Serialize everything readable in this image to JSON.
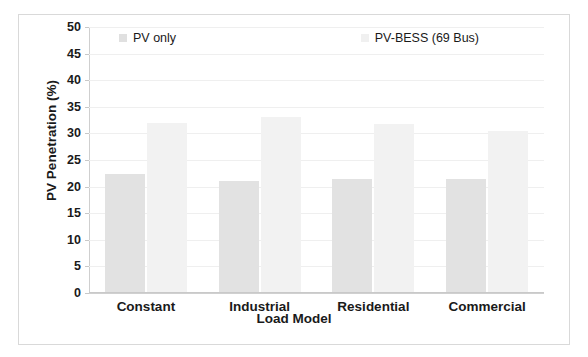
{
  "chart_data": {
    "type": "bar",
    "title": "",
    "xlabel": "Load Model",
    "ylabel": "PV Penetration (%)",
    "categories": [
      "Constant",
      "Industrial",
      "Residential",
      "Commercial"
    ],
    "series": [
      {
        "name": "PV only",
        "color": "#e2e2e2",
        "values": [
          22.4,
          21.0,
          21.5,
          21.5
        ]
      },
      {
        "name": "PV-BESS (69 Bus)",
        "color": "#f2f2f2",
        "values": [
          32.0,
          33.0,
          31.8,
          30.5
        ]
      }
    ],
    "ylim": [
      0,
      50
    ],
    "ytick_step": 5,
    "yticks": [
      50,
      45,
      40,
      35,
      30,
      25,
      20,
      15,
      10,
      5,
      0
    ],
    "ytick_labels": [
      "50",
      "45",
      "40",
      "35",
      "30",
      "25",
      "20",
      "15",
      "10",
      "5",
      "0"
    ],
    "grid": true,
    "grid_axis": "y",
    "legend_position": "top-inside",
    "legend": [
      "PV only",
      "PV-BESS (69 Bus)"
    ],
    "frame_border_color": "#d9d9d9",
    "background_color": "#ffffff"
  }
}
